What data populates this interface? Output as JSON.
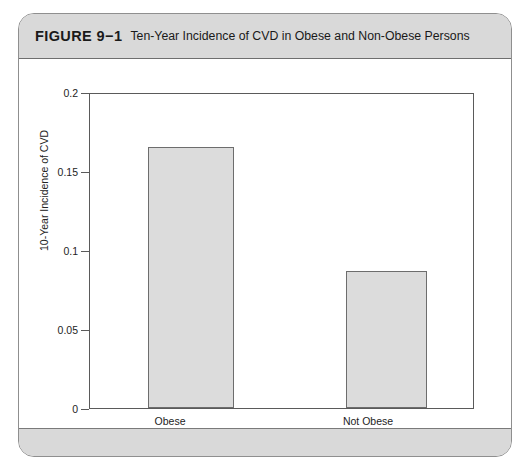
{
  "figure": {
    "label": "FIGURE 9−1",
    "caption": "Ten-Year Incidence of CVD in Obese and Non-Obese Persons"
  },
  "chart_data": {
    "type": "bar",
    "title": "Ten-Year Incidence of CVD in Obese and Non-Obese Persons",
    "categories": [
      "Obese",
      "Not Obese"
    ],
    "values": [
      0.165,
      0.087
    ],
    "xlabel": "",
    "ylabel": "10-Year Incidence of CVD",
    "ylim": [
      0,
      0.2
    ],
    "yticks": [
      0,
      0.05,
      0.1,
      0.15,
      0.2
    ],
    "ytick_labels": [
      "0",
      "0.05",
      "0.1",
      "0.15",
      "0.2"
    ],
    "grid": false,
    "legend": null,
    "bar_fill_color": "#dcdcdc",
    "bar_border_color": "#6d6d6d",
    "axis_color": "#5a5a5a"
  }
}
